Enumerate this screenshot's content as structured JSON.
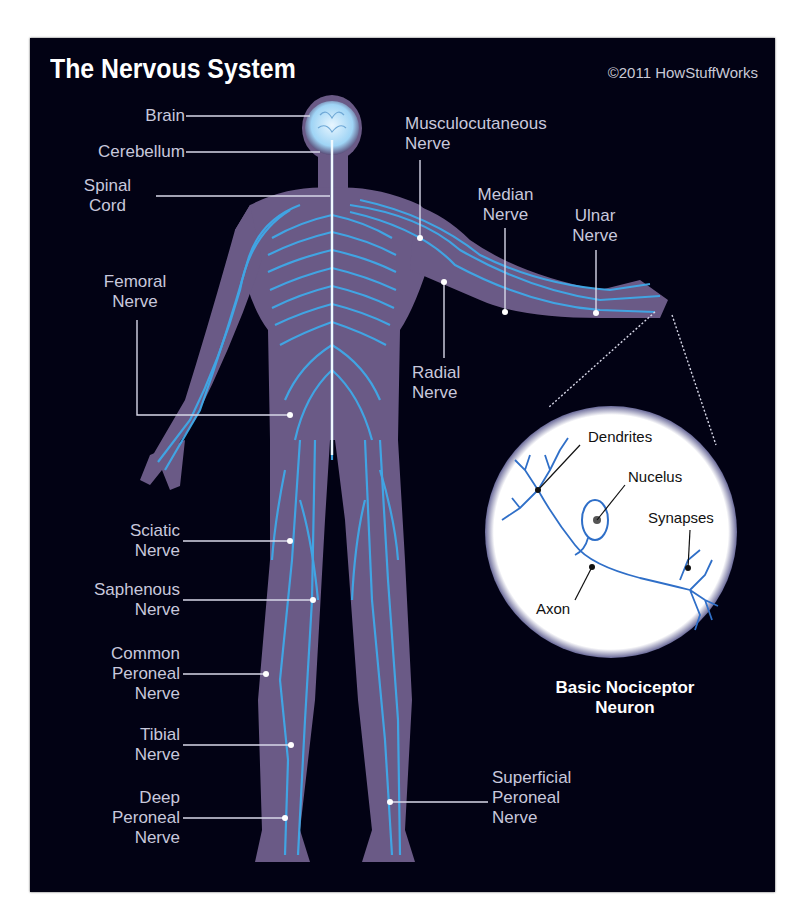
{
  "header": {
    "title": "The Nervous System",
    "credit": "©2011 HowStuffWorks"
  },
  "labels_left": [
    {
      "id": "brain",
      "lines": [
        "Brain"
      ]
    },
    {
      "id": "cerebellum",
      "lines": [
        "Cerebellum"
      ]
    },
    {
      "id": "spinal-cord",
      "lines": [
        "Spinal",
        "Cord"
      ]
    },
    {
      "id": "femoral-nerve",
      "lines": [
        "Femoral",
        "Nerve"
      ]
    },
    {
      "id": "sciatic-nerve",
      "lines": [
        "Sciatic",
        "Nerve"
      ]
    },
    {
      "id": "saphenous-nerve",
      "lines": [
        "Saphenous",
        "Nerve"
      ]
    },
    {
      "id": "common-peroneal-nerve",
      "lines": [
        "Common",
        "Peroneal",
        "Nerve"
      ]
    },
    {
      "id": "tibial-nerve",
      "lines": [
        "Tibial",
        "Nerve"
      ]
    },
    {
      "id": "deep-peroneal-nerve",
      "lines": [
        "Deep",
        "Peroneal",
        "Nerve"
      ]
    }
  ],
  "labels_right": [
    {
      "id": "musculocutaneous-nerve",
      "lines": [
        "Musculocutaneous",
        "Nerve"
      ]
    },
    {
      "id": "median-nerve",
      "lines": [
        "Median",
        "Nerve"
      ]
    },
    {
      "id": "ulnar-nerve",
      "lines": [
        "Ulnar",
        "Nerve"
      ]
    },
    {
      "id": "radial-nerve",
      "lines": [
        "Radial",
        "Nerve"
      ]
    },
    {
      "id": "superficial-peroneal-nerve",
      "lines": [
        "Superficial",
        "Peroneal",
        "Nerve"
      ]
    }
  ],
  "neuron_inset": {
    "labels": {
      "dendrites": "Dendrites",
      "nucleus": "Nucelus",
      "synapses": "Synapses",
      "axon": "Axon"
    },
    "caption": [
      "Basic Nociceptor",
      "Neuron"
    ]
  },
  "colors": {
    "background": "#020214",
    "body": "#6a5a86",
    "nerve": "#3fa9e8",
    "label_text": "#c8c8dc",
    "inset_fill": "#ffffff",
    "neuron": "#2f6fc8"
  }
}
